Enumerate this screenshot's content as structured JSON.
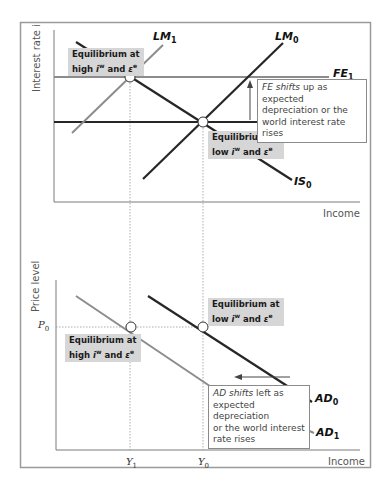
{
  "top_panel": {
    "y_axis_label": "Interest rate i",
    "x_axis_label": "Income",
    "curves": [
      {
        "id": "LM1",
        "name": "LM",
        "sub": "1",
        "color": "#8c8c8c"
      },
      {
        "id": "LM0",
        "name": "LM",
        "sub": "0",
        "color": "#262626"
      },
      {
        "id": "FE1",
        "name": "FE",
        "sub": "1",
        "color": "#8c8c8c"
      },
      {
        "id": "FE0",
        "name": "FE",
        "sub": "0",
        "color": "#262626"
      },
      {
        "id": "IS0",
        "name": "IS",
        "sub": "0",
        "color": "#262626"
      }
    ],
    "equilibrium_high": {
      "line1": "Equilibrium at",
      "line2_pre": "high ",
      "line2_i": "i",
      "line2_sup": "w",
      "line2_mid": " and ",
      "line2_e": "ε",
      "line2_esup": "e"
    },
    "equilibrium_low": {
      "line1": "Equilibrium at",
      "line2_pre": "low ",
      "line2_i": "i",
      "line2_sup": "w",
      "line2_mid": " and ",
      "line2_e": "ε",
      "line2_esup": "e"
    },
    "note": {
      "italic": "FE shifts",
      "rest1": " up as expected",
      "line2": "depreciation or the",
      "line3": "world interest rate rises"
    }
  },
  "bottom_panel": {
    "y_axis_label": "Price level",
    "x_axis_label": "Income",
    "p_label": "P",
    "p_sub": "0",
    "y1_label": "Y",
    "y1_sub": "1",
    "y0_label": "Y",
    "y0_sub": "0",
    "curves": [
      {
        "id": "AD0",
        "name": "AD",
        "sub": "0",
        "color": "#262626"
      },
      {
        "id": "AD1",
        "name": "AD",
        "sub": "1",
        "color": "#8c8c8c"
      }
    ],
    "equilibrium_high": {
      "line1": "Equilibrium at",
      "line2_pre": "high ",
      "line2_i": "i",
      "line2_sup": "w",
      "line2_mid": " and ",
      "line2_e": "ε",
      "line2_esup": "e"
    },
    "equilibrium_low": {
      "line1": "Equilibrium at",
      "line2_pre": "low ",
      "line2_i": "i",
      "line2_sup": "w",
      "line2_mid": " and ",
      "line2_e": "ε",
      "line2_esup": "e"
    },
    "note": {
      "italic": "AD shifts",
      "rest1": " left as",
      "line2": "expected depreciation",
      "line3": "or the world interest",
      "line4": "rate rises"
    }
  },
  "colors": {
    "dark_line": "#262626",
    "light_line": "#8c8c8c",
    "label_bg": "#d6d6d6",
    "frame": "#9a9a9a",
    "axis": "#7a7a7a"
  }
}
